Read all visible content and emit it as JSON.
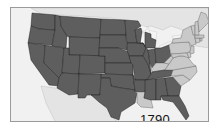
{
  "map": {
    "year_label": "1790",
    "legend": {
      "dark": {
        "color": "#5e5e5e"
      },
      "light": {
        "color": "#c9c9c9"
      }
    },
    "background_color": "#f1f1f1",
    "states": [
      {
        "name": "Washington",
        "shade": "dark"
      },
      {
        "name": "Oregon",
        "shade": "dark"
      },
      {
        "name": "California",
        "shade": "dark"
      },
      {
        "name": "Idaho",
        "shade": "dark"
      },
      {
        "name": "Nevada",
        "shade": "dark"
      },
      {
        "name": "Montana",
        "shade": "dark"
      },
      {
        "name": "Wyoming",
        "shade": "dark"
      },
      {
        "name": "Utah",
        "shade": "dark"
      },
      {
        "name": "Arizona",
        "shade": "dark"
      },
      {
        "name": "Colorado",
        "shade": "dark"
      },
      {
        "name": "New Mexico",
        "shade": "dark"
      },
      {
        "name": "North Dakota",
        "shade": "dark"
      },
      {
        "name": "South Dakota",
        "shade": "dark"
      },
      {
        "name": "Nebraska",
        "shade": "dark"
      },
      {
        "name": "Kansas",
        "shade": "dark"
      },
      {
        "name": "Oklahoma",
        "shade": "dark"
      },
      {
        "name": "Texas",
        "shade": "dark"
      },
      {
        "name": "Minnesota",
        "shade": "dark"
      },
      {
        "name": "Iowa",
        "shade": "dark"
      },
      {
        "name": "Missouri",
        "shade": "dark"
      },
      {
        "name": "Arkansas",
        "shade": "dark"
      },
      {
        "name": "Louisiana",
        "shade": "light"
      },
      {
        "name": "Wisconsin",
        "shade": "dark"
      },
      {
        "name": "Illinois",
        "shade": "dark"
      },
      {
        "name": "Michigan",
        "shade": "dark"
      },
      {
        "name": "Indiana",
        "shade": "dark"
      },
      {
        "name": "Ohio",
        "shade": "dark"
      },
      {
        "name": "Kentucky",
        "shade": "light"
      },
      {
        "name": "Tennessee",
        "shade": "dark"
      },
      {
        "name": "Mississippi",
        "shade": "dark"
      },
      {
        "name": "Alabama",
        "shade": "dark"
      },
      {
        "name": "Georgia",
        "shade": "dark"
      },
      {
        "name": "Florida",
        "shade": "dark"
      },
      {
        "name": "South Carolina",
        "shade": "light"
      },
      {
        "name": "North Carolina",
        "shade": "light"
      },
      {
        "name": "Virginia",
        "shade": "light"
      },
      {
        "name": "West Virginia",
        "shade": "light"
      },
      {
        "name": "Pennsylvania",
        "shade": "light"
      },
      {
        "name": "New York",
        "shade": "light"
      },
      {
        "name": "Maryland",
        "shade": "light"
      },
      {
        "name": "Delaware",
        "shade": "light"
      },
      {
        "name": "New Jersey",
        "shade": "light"
      },
      {
        "name": "Connecticut",
        "shade": "light"
      },
      {
        "name": "Rhode Island",
        "shade": "light"
      },
      {
        "name": "Massachusetts",
        "shade": "light"
      },
      {
        "name": "Vermont",
        "shade": "light"
      },
      {
        "name": "New Hampshire",
        "shade": "light"
      },
      {
        "name": "Maine",
        "shade": "light"
      }
    ]
  }
}
